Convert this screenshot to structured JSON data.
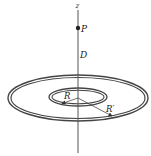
{
  "diagram": {
    "axis_label": "z",
    "point_label": "P",
    "distance_label": "D",
    "inner_radius_label": "R",
    "outer_radius_label": "R′",
    "colors": {
      "line": "#333333",
      "ring": "#444444",
      "background": "#ffffff"
    }
  }
}
